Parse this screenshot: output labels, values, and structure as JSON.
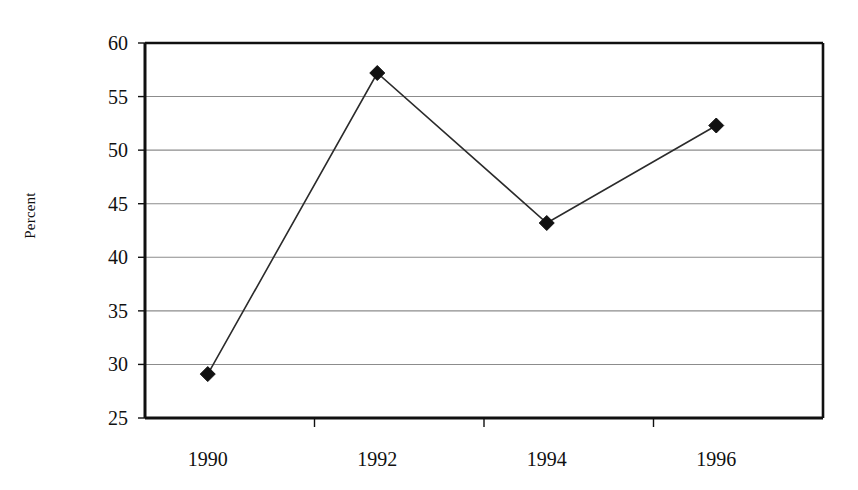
{
  "chart_data": {
    "type": "line",
    "title": "",
    "xlabel": "",
    "ylabel": "Percent",
    "categories": [
      "1990",
      "1992",
      "1994",
      "1996"
    ],
    "x": [
      1990,
      1992,
      1994,
      1996
    ],
    "values": [
      29.1,
      57.2,
      43.2,
      52.3
    ],
    "series": [
      {
        "name": "Percent",
        "values": [
          29.1,
          57.2,
          43.2,
          52.3
        ]
      }
    ],
    "ylim": [
      25,
      60
    ],
    "yticks": [
      25,
      30,
      35,
      40,
      45,
      50,
      55,
      60
    ],
    "ytick_labels": [
      "25",
      "30",
      "35",
      "40",
      "45",
      "50",
      "55",
      "60"
    ],
    "xtick_labels": [
      "1990",
      "1992",
      "1994",
      "1996"
    ],
    "grid": "horizontal",
    "legend": "none",
    "marker": "diamond",
    "line_color": "#2b2b2b",
    "marker_color": "#111111",
    "grid_color": "#8c8c8c",
    "axis_color": "#101010",
    "plot_background": "#ffffff"
  }
}
